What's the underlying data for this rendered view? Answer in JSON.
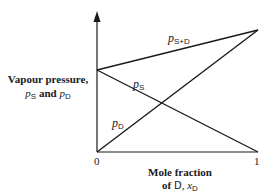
{
  "diagram": {
    "title": "",
    "y_axis": {
      "label_line1": "Vapour pressure,",
      "label_line2_var1": "p",
      "label_line2_sub1": "S",
      "label_line2_and": " and ",
      "label_line2_var2": "p",
      "label_line2_sub2": "D"
    },
    "x_axis": {
      "label_line1": "Mole fraction",
      "label_line2_of": "of ",
      "label_line2_symbol": "D",
      "label_line2_comma": ", ",
      "label_line2_var": "x",
      "label_line2_sub": "D",
      "tick_min": "0",
      "tick_max": "1"
    },
    "curves": [
      {
        "id": "p_S+D",
        "var": "p",
        "sub": "S+D",
        "from": [
          0,
          0.72
        ],
        "to": [
          1,
          1.0
        ]
      },
      {
        "id": "p_S",
        "var": "p",
        "sub": "S",
        "from": [
          0,
          0.72
        ],
        "to": [
          1,
          0
        ]
      },
      {
        "id": "p_D",
        "var": "p",
        "sub": "D",
        "from": [
          0,
          0
        ],
        "to": [
          1,
          1.0
        ]
      }
    ],
    "colors": {
      "line": "#1a1a1a",
      "background": "#ffffff"
    }
  }
}
